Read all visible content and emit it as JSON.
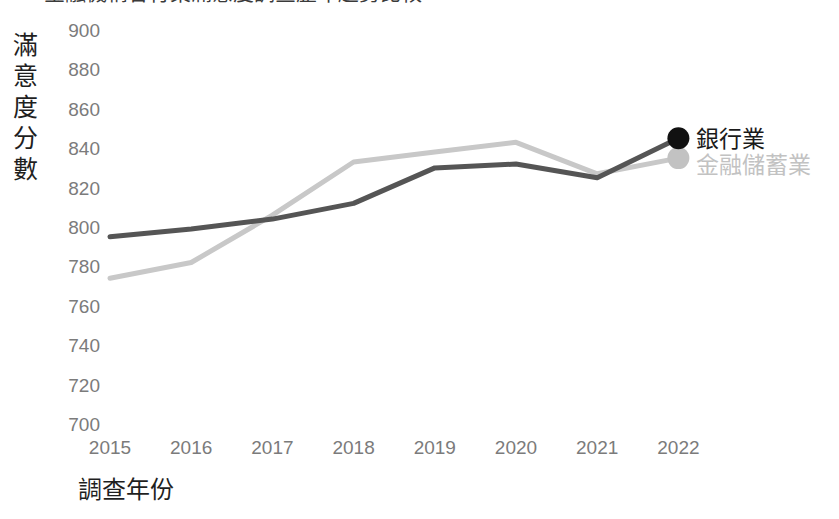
{
  "chart_data": {
    "type": "line",
    "title": "金融機構各行業滿意度調查歷年趨勢比較",
    "xlabel": "調查年份",
    "ylabel": "滿意度分數",
    "categories": [
      "2015",
      "2016",
      "2017",
      "2018",
      "2019",
      "2020",
      "2021",
      "2022"
    ],
    "ylim": [
      700,
      900
    ],
    "yticks": [
      900,
      880,
      860,
      840,
      820,
      800,
      780,
      760,
      740,
      720,
      700
    ],
    "grid": false,
    "legend_position": "right-end-of-line",
    "series": [
      {
        "name": "銀行業",
        "color": "#555555",
        "marker_color": "#111111",
        "values": [
          795,
          799,
          804,
          812,
          830,
          832,
          825,
          845
        ],
        "end_marker": true
      },
      {
        "name": "金融儲蓄業",
        "color": "#c8c8c8",
        "marker_color": "#c2c2c2",
        "values": [
          774,
          782,
          806,
          833,
          838,
          843,
          827,
          835
        ],
        "end_marker": true
      }
    ]
  },
  "axis": {
    "y_title": "滿意度分數",
    "y_title_chars": [
      "滿",
      "意",
      "度",
      "分",
      "數"
    ],
    "x_title": "調查年份"
  },
  "legend": {
    "items": [
      {
        "label": "銀行業",
        "color": "#111111"
      },
      {
        "label": "金融儲蓄業",
        "color": "#c2c2c2"
      }
    ]
  }
}
